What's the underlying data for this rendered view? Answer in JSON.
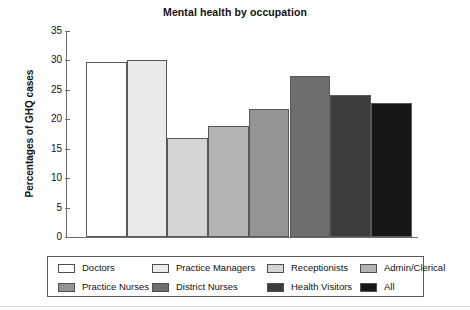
{
  "chart_data": {
    "type": "bar",
    "title": "Mental health by occupation",
    "xlabel": "",
    "ylabel": "Percentages of GHQ cases",
    "ylim": [
      0,
      35
    ],
    "ytick_step": 5,
    "yticks": [
      "35",
      "30",
      "25",
      "20",
      "15",
      "10",
      "5",
      "0"
    ],
    "grid": false,
    "legend_position": "bottom",
    "categories": [
      "Doctors",
      "Practice Managers",
      "Receptionists",
      "Admin/Clerical",
      "Practice Nurses",
      "District Nurses",
      "Health Visitors",
      "All"
    ],
    "values": [
      29.8,
      30.0,
      16.9,
      18.8,
      21.7,
      27.4,
      24.1,
      22.7
    ],
    "colors": [
      "#fdfdfd",
      "#eaeaea",
      "#d5d5d5",
      "#b4b4b4",
      "#949494",
      "#6e6e6e",
      "#3c3c3c",
      "#171717"
    ]
  },
  "legend": {
    "rows": [
      [
        {
          "label": "Doctors",
          "color": "#fdfdfd"
        },
        {
          "label": "Practice Managers",
          "color": "#eaeaea"
        },
        {
          "label": "Receptionists",
          "color": "#d5d5d5"
        },
        {
          "label": "Admin/Clerical",
          "color": "#b4b4b4"
        }
      ],
      [
        {
          "label": "Practice Nurses",
          "color": "#949494"
        },
        {
          "label": "District Nurses",
          "color": "#6e6e6e"
        },
        {
          "label": "Health Visitors",
          "color": "#3c3c3c"
        },
        {
          "label": "All",
          "color": "#171717"
        }
      ]
    ]
  }
}
